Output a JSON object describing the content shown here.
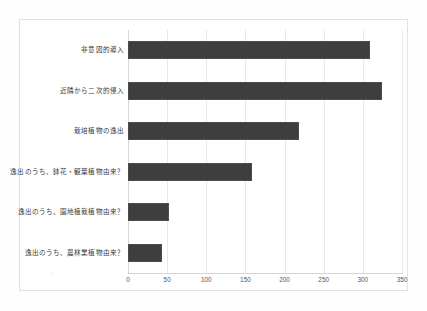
{
  "figure": {
    "background_color": "#ffffff",
    "frame_color": "#e2e2e2",
    "bar_color": "#3e3e3e",
    "gridline_color": "#e8e8e8"
  },
  "chart_data": {
    "type": "bar",
    "orientation": "horizontal",
    "title": "",
    "xlabel": "",
    "ylabel": "",
    "xlim": [
      0,
      350
    ],
    "grid": true,
    "legend": null,
    "xticks": [
      "0",
      "50",
      "100",
      "150",
      "200",
      "250",
      "300",
      "350"
    ],
    "xtick_values": [
      0,
      50,
      100,
      150,
      200,
      250,
      300,
      350
    ],
    "categories": [
      "非意図的導入",
      "近隣から二次的侵入",
      "栽培植物の逸出",
      "逸出のうち、鉢花・観葉植物由来？",
      "逸出のうち、園地植栽植物由来？",
      "逸出のうち、農林業植物由来？"
    ],
    "values": [
      309,
      325,
      218,
      159,
      53,
      44
    ]
  }
}
